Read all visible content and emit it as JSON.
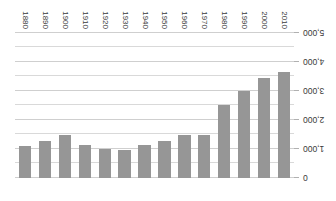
{
  "chart_data": {
    "type": "bar",
    "title": "",
    "subtitle": "",
    "xlabel": "",
    "ylabel": "",
    "orientation": "vertical-inverted",
    "rotated_180": true,
    "grid": true,
    "legend": false,
    "legend_position": "none",
    "bar_color": "#969696",
    "gridline_color": "#d9d9d9",
    "axis_text_color": "#3a3a3a",
    "background_color": "#ffffff",
    "ylim": [
      0,
      5000
    ],
    "ytick_step": 1000,
    "yminor_step": 500,
    "ytick_labels": [
      "0",
      "1,000",
      "2,000",
      "3,000",
      "4,000",
      "5,000"
    ],
    "ytick_values": [
      0,
      1000,
      2000,
      3000,
      4000,
      5000
    ],
    "categories": [
      "2010",
      "2000",
      "1990",
      "1980",
      "1970",
      "1960",
      "1950",
      "1940",
      "1930",
      "1920",
      "1910",
      "1900",
      "1890",
      "1880"
    ],
    "values": [
      3650,
      3450,
      3000,
      2500,
      1480,
      1480,
      1280,
      1140,
      970,
      1000,
      1140,
      1480,
      1280,
      1100
    ]
  }
}
